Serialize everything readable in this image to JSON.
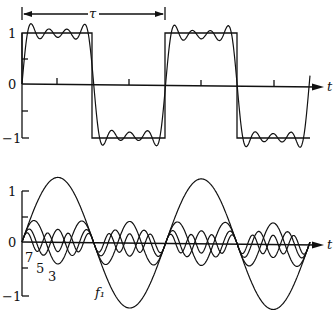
{
  "figure": {
    "top_panel": {
      "title": "Square wave and its Fourier partial sum (harmonics 1,3,5,7)",
      "y_tick_labels": [
        "1",
        "0",
        "−1"
      ],
      "x_axis_label": "t",
      "period_label": "τ"
    },
    "bottom_panel": {
      "title": "Fourier components",
      "y_tick_labels": [
        "1",
        "0",
        "−1"
      ],
      "x_axis_label": "t",
      "curve_labels": [
        "7",
        "5",
        "3",
        "f₁"
      ]
    }
  },
  "chart_data": [
    {
      "type": "line",
      "title": "Square wave approximated by sum of odd harmonics",
      "xlabel": "t",
      "ylabel": "",
      "ylim": [
        -1.2,
        1.2
      ],
      "yticks": [
        -1,
        0,
        1
      ],
      "annotations": [
        "τ (period, shown with double-headed arrow)"
      ],
      "period": 1,
      "x_range_periods": [
        0,
        2
      ],
      "series": [
        {
          "name": "square wave",
          "x": [
            0,
            0,
            0.5,
            0.5,
            1,
            1,
            1.5,
            1.5,
            2
          ],
          "values": [
            0,
            1,
            1,
            -1,
            -1,
            1,
            1,
            -1,
            -1
          ]
        },
        {
          "name": "partial sum f1+f3+f5+f7",
          "formula": "(4/π) Σ_{n=1,3,5,7} sin(2πnt/τ)/n"
        }
      ],
      "grid": false,
      "legend": "none"
    },
    {
      "type": "line",
      "title": "Harmonic components",
      "xlabel": "t",
      "ylabel": "",
      "ylim": [
        -1.3,
        1.3
      ],
      "yticks": [
        -1,
        0,
        1
      ],
      "series": [
        {
          "name": "f1",
          "amplitude": 1.273,
          "harmonic": 1
        },
        {
          "name": "3",
          "amplitude": 0.424,
          "harmonic": 3
        },
        {
          "name": "5",
          "amplitude": 0.255,
          "harmonic": 5
        },
        {
          "name": "7",
          "amplitude": 0.182,
          "harmonic": 7
        }
      ],
      "grid": false,
      "legend": "inline labels"
    }
  ]
}
